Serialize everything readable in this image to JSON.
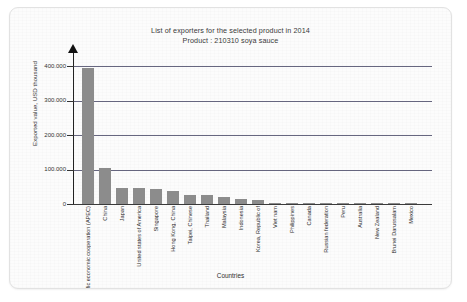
{
  "card": {
    "title_line1": "List of exporters for the selected product in 2014",
    "title_line2": "Product : 210310 soya sauce"
  },
  "chart_data": {
    "type": "bar",
    "title": "List of exporters for the selected product in 2014",
    "subtitle": "Product : 210310 soya sauce",
    "xlabel": "Countries",
    "ylabel": "Exported value, USD thousand",
    "ylim": [
      0,
      430000
    ],
    "yticks": [
      0,
      100000,
      200000,
      300000,
      400000
    ],
    "ytick_labels": [
      "0",
      "100.000",
      "200.000",
      "300.000",
      "400.000"
    ],
    "grid": true,
    "legend": "none",
    "bar_color": "#8c8c8c",
    "categories": [
      "Asia-pacific economic cooperation (APEC)",
      "China",
      "Japan",
      "United states of America",
      "Singapore",
      "Hong Kong, China",
      "Taipei, Chinese",
      "Thailand",
      "Malaysia",
      "Indonesia",
      "Korea, Republic of",
      "Viet nam",
      "Philippines",
      "Canada",
      "Russian federation",
      "Peru",
      "Australia",
      "New Zealand",
      "Brunei Darussalam",
      "Mexico"
    ],
    "values": [
      395000,
      105000,
      47000,
      47000,
      44000,
      38000,
      27000,
      26000,
      20000,
      16000,
      13000,
      4000,
      2500,
      2000,
      1500,
      1200,
      900,
      700,
      400,
      200
    ]
  }
}
